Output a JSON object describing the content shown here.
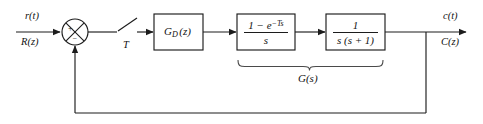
{
  "diagram": {
    "type": "control-block-diagram",
    "background_color": "#ffffff",
    "line_color": "#1c1c1c",
    "input": {
      "label_time": "r(t)",
      "label_z": "R(z)"
    },
    "output": {
      "label_time": "c(t)",
      "label_z": "C(z)"
    },
    "summing_junction": {
      "name": "summing-junction",
      "positive_sign": "+",
      "negative_sign": "−"
    },
    "sampler": {
      "label": "T",
      "name": "sampler-switch"
    },
    "blocks": [
      {
        "id": "controller",
        "name": "block-digital-controller",
        "kind": "plain",
        "label": "G",
        "label_sub": "D",
        "label_arg": "(z)"
      },
      {
        "id": "zoh",
        "name": "block-zero-order-hold",
        "kind": "fraction",
        "numerator_pre": "1 − e",
        "numerator_exp": "−Ts",
        "denominator": "s"
      },
      {
        "id": "plant",
        "name": "block-plant",
        "kind": "fraction",
        "numerator_pre": "1",
        "numerator_exp": "",
        "denominator": "s (s + 1)"
      }
    ],
    "brace": {
      "name": "plant-group-brace",
      "label": "G(s)",
      "covers": [
        "zoh",
        "plant"
      ]
    },
    "feedback": {
      "name": "feedback-path",
      "label": ""
    }
  }
}
